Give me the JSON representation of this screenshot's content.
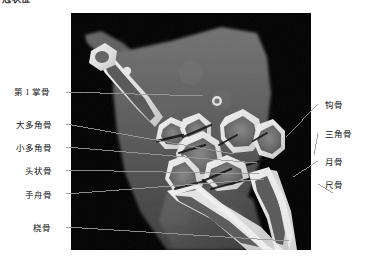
{
  "figure": {
    "heading": "冠状位",
    "modality": "CT",
    "view": "coronal"
  },
  "image_plate": {
    "name": "wrist-ct-coronal",
    "background_color": "#000000",
    "bone_color": "#f2f2f2",
    "soft_tissue_color": "#5a5a5a",
    "frame": {
      "x": 71,
      "y": 13,
      "width": 240,
      "height": 237
    }
  },
  "annotations": {
    "leader_color": "#9a9a9a",
    "left": [
      {
        "label": "第 1 掌骨",
        "x": 14,
        "y": 87,
        "line_from": [
          66,
          92
        ],
        "line_to": [
          132,
          83
        ]
      },
      {
        "label": "大多角骨",
        "x": 16,
        "y": 120,
        "line_from": [
          66,
          124
        ],
        "line_to": [
          163,
          141
        ]
      },
      {
        "label": "小多角骨",
        "x": 16,
        "y": 143,
        "line_from": [
          66,
          147
        ],
        "line_to": [
          186,
          150
        ]
      },
      {
        "label": "头状骨",
        "x": 25,
        "y": 166,
        "line_from": [
          66,
          170
        ],
        "line_to": [
          188,
          161
        ]
      },
      {
        "label": "手舟骨",
        "x": 25,
        "y": 190,
        "line_from": [
          66,
          194
        ],
        "line_to": [
          193,
          166
        ]
      },
      {
        "label": "桡骨",
        "x": 33,
        "y": 223,
        "line_from": [
          66,
          227
        ],
        "line_to": [
          218,
          228
        ]
      }
    ],
    "right": [
      {
        "label": "钩骨",
        "x": 325,
        "y": 100,
        "line_from": [
          318,
          104
        ],
        "line_to": [
          215,
          124
        ]
      },
      {
        "label": "三角骨",
        "x": 325,
        "y": 129,
        "line_from": [
          318,
          133
        ],
        "line_to": [
          243,
          142
        ]
      },
      {
        "label": "月骨",
        "x": 325,
        "y": 157,
        "line_from": [
          318,
          161
        ],
        "line_to": [
          222,
          164
        ]
      },
      {
        "label": "尺骨",
        "x": 325,
        "y": 180,
        "line_from": [
          318,
          184
        ],
        "line_to": [
          262,
          180
        ]
      }
    ]
  }
}
